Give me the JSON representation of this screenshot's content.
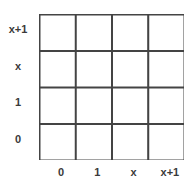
{
  "diagram": {
    "type": "grid",
    "rows": 4,
    "cols": 4,
    "row_labels": [
      "x+1",
      "x",
      "1",
      "0"
    ],
    "col_labels": [
      "0",
      "1",
      "x",
      "x+1"
    ],
    "line_color": "#444444",
    "label_color": "#3a3a3a"
  }
}
